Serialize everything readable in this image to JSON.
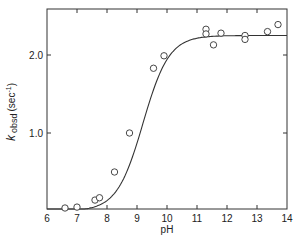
{
  "chart_data": {
    "type": "scatter",
    "title": "",
    "xlabel": "pH",
    "ylabel": "k obsd (sec-1)",
    "ylabel_parts": {
      "k": "k",
      "sub": "obsd",
      "unit": "(sec",
      "sup": "-1",
      "close": ")"
    },
    "xlim": [
      6,
      14
    ],
    "ylim": [
      0,
      2.6
    ],
    "x_ticks": [
      6,
      7,
      8,
      9,
      10,
      11,
      12,
      13,
      14
    ],
    "x_tick_labels": [
      "6",
      "7",
      "8",
      "9",
      "10",
      "11",
      "12",
      "13",
      "14"
    ],
    "y_ticks": [
      1.0,
      2.0
    ],
    "y_tick_labels": [
      "1.0",
      "2.0"
    ],
    "grid": false,
    "legend": null,
    "series": [
      {
        "name": "observed",
        "marker": "open-circle",
        "points": [
          {
            "x": 6.6,
            "y": 0.03
          },
          {
            "x": 7.0,
            "y": 0.05
          },
          {
            "x": 7.6,
            "y": 0.14
          },
          {
            "x": 7.75,
            "y": 0.17
          },
          {
            "x": 8.25,
            "y": 0.5
          },
          {
            "x": 8.75,
            "y": 1.0
          },
          {
            "x": 9.55,
            "y": 1.83
          },
          {
            "x": 9.9,
            "y": 1.99
          },
          {
            "x": 11.3,
            "y": 2.33
          },
          {
            "x": 11.3,
            "y": 2.27
          },
          {
            "x": 11.55,
            "y": 2.13
          },
          {
            "x": 11.8,
            "y": 2.28
          },
          {
            "x": 12.6,
            "y": 2.25
          },
          {
            "x": 12.6,
            "y": 2.2
          },
          {
            "x": 13.35,
            "y": 2.3
          },
          {
            "x": 13.7,
            "y": 2.39
          }
        ]
      },
      {
        "name": "fit",
        "type": "line",
        "model": "sigmoid titration curve",
        "plateau": 2.25,
        "pKa": 9.2,
        "points": [
          {
            "x": 6.0,
            "y": 0.0
          },
          {
            "x": 6.6,
            "y": 0.0
          },
          {
            "x": 7.0,
            "y": 0.03
          },
          {
            "x": 7.5,
            "y": 0.1
          },
          {
            "x": 8.0,
            "y": 0.28
          },
          {
            "x": 8.5,
            "y": 0.65
          },
          {
            "x": 9.0,
            "y": 1.15
          },
          {
            "x": 9.5,
            "y": 1.7
          },
          {
            "x": 10.0,
            "y": 2.0
          },
          {
            "x": 10.5,
            "y": 2.13
          },
          {
            "x": 11.0,
            "y": 2.2
          },
          {
            "x": 11.5,
            "y": 2.23
          },
          {
            "x": 12.0,
            "y": 2.24
          },
          {
            "x": 13.0,
            "y": 2.25
          },
          {
            "x": 14.0,
            "y": 2.25
          }
        ]
      }
    ]
  }
}
